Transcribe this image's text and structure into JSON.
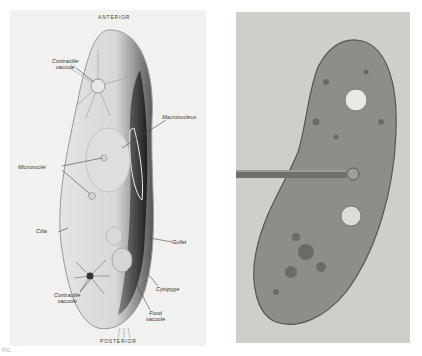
{
  "drawing": {
    "top_label": "ANTERIOR",
    "bottom_label": "POSTERIOR",
    "labels": {
      "contractile_vacuole_top": "Contractile\nvacuole",
      "macronucleus": "Macronucleus",
      "micronuclei": "Micronuclei",
      "cilia": "Cilia",
      "gullet": "Gullet",
      "cytopyge": "Cytopyge",
      "contractile_vacuole_bottom": "Contractile\nvacuole",
      "food_vacuole": "Food\nvacuole"
    }
  },
  "photo": {
    "subject": "paramecium-micrograph-with-micropipette"
  },
  "caption": "FIG. ..."
}
